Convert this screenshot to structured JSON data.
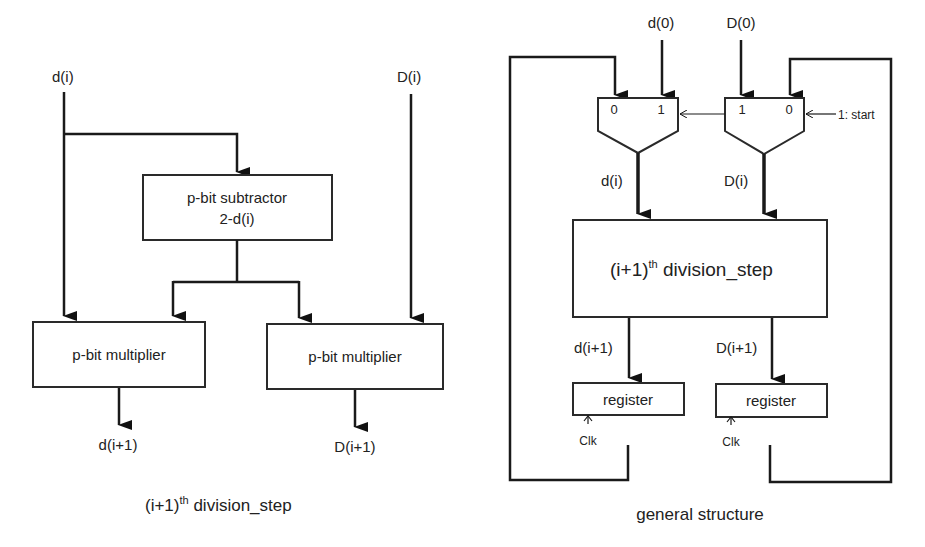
{
  "left_diagram": {
    "caption_main": "(i+1)",
    "caption_sup": "th",
    "caption_rest": " division_step",
    "inputs": {
      "d": "d(i)",
      "D": "D(i)"
    },
    "subtractor": {
      "line1": "p-bit subtractor",
      "line2": "2-d(i)"
    },
    "multiplier_left": "p-bit multiplier",
    "multiplier_right": "p-bit multiplier",
    "outputs": {
      "d": "d(i+1)",
      "D": "D(i+1)"
    }
  },
  "right_diagram": {
    "caption": "general structure",
    "inputs": {
      "d0": "d(0)",
      "D0": "D(0)"
    },
    "mux_left": {
      "in0": "0",
      "in1": "1"
    },
    "mux_right": {
      "in1": "1",
      "in0": "0"
    },
    "select_label": "1: start",
    "mux_outputs": {
      "d": "d(i)",
      "D": "D(i)"
    },
    "step_block": {
      "main": "(i+1)",
      "sup": "th",
      "rest": " division_step"
    },
    "step_outputs": {
      "d": "d(i+1)",
      "D": "D(i+1)"
    },
    "register_left": "register",
    "register_right": "register",
    "clock_left": "Clk",
    "clock_right": "Clk"
  }
}
